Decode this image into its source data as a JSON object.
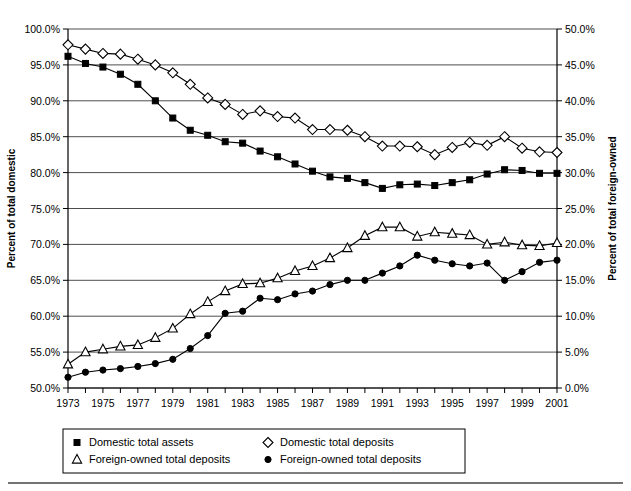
{
  "chart_data": {
    "type": "line",
    "title": "",
    "xlabel": "",
    "ylabel": "Percent of total domestic",
    "y2label": "Percent of total foreign-owned",
    "grid": true,
    "legend_position": "bottom",
    "xlim": [
      1973,
      2001
    ],
    "ylim": [
      50.0,
      100.0
    ],
    "y2lim": [
      0.0,
      50.0
    ],
    "x": [
      1973,
      1974,
      1975,
      1976,
      1977,
      1978,
      1979,
      1980,
      1981,
      1982,
      1983,
      1984,
      1985,
      1986,
      1987,
      1988,
      1989,
      1990,
      1991,
      1992,
      1993,
      1994,
      1995,
      1996,
      1997,
      1998,
      1999,
      2000,
      2001
    ],
    "xtick_labels": [
      "1973",
      "",
      "1975",
      "",
      "1977",
      "",
      "1979",
      "",
      "1981",
      "",
      "1983",
      "",
      "1985",
      "",
      "1987",
      "",
      "1989",
      "",
      "1991",
      "",
      "1993",
      "",
      "1995",
      "",
      "1997",
      "",
      "1999",
      "",
      "2001"
    ],
    "ytick_labels": [
      "50.0%",
      "55.0%",
      "60.0%",
      "65.0%",
      "70.0%",
      "75.0%",
      "80.0%",
      "85.0%",
      "90.0%",
      "95.0%",
      "100.0%"
    ],
    "ytick_values": [
      50,
      55,
      60,
      65,
      70,
      75,
      80,
      85,
      90,
      95,
      100
    ],
    "y2tick_labels": [
      "0.0%",
      "5.0%",
      "10.0%",
      "15.0%",
      "20.0%",
      "25.0%",
      "30.0%",
      "35.0%",
      "40.0%",
      "45.0%",
      "50.0%"
    ],
    "y2tick_values": [
      0,
      5,
      10,
      15,
      20,
      25,
      30,
      35,
      40,
      45,
      50
    ],
    "series": [
      {
        "name": "Domestic total assets",
        "marker": "filled-square",
        "axis": "left",
        "values": [
          96.2,
          95.2,
          94.7,
          93.7,
          92.3,
          90.0,
          87.6,
          85.9,
          85.2,
          84.3,
          84.1,
          83.0,
          82.2,
          81.2,
          80.2,
          79.4,
          79.2,
          78.6,
          77.8,
          78.3,
          78.4,
          78.2,
          78.6,
          79.0,
          79.8,
          80.4,
          80.3,
          79.9,
          79.9
        ]
      },
      {
        "name": "Domestic total deposits",
        "marker": "open-diamond",
        "axis": "left",
        "values": [
          97.8,
          97.2,
          96.6,
          96.5,
          95.8,
          95.0,
          93.9,
          92.3,
          90.4,
          89.5,
          88.1,
          88.6,
          87.8,
          87.6,
          86.0,
          86.0,
          85.9,
          85.0,
          83.7,
          83.7,
          83.6,
          82.5,
          83.5,
          84.2,
          83.8,
          85.0,
          83.4,
          82.9,
          82.8
        ]
      },
      {
        "name": "Foreign-owned total deposits",
        "marker": "open-triangle",
        "axis": "left",
        "values": [
          53.3,
          55.0,
          55.4,
          55.8,
          56.0,
          57.0,
          58.3,
          60.3,
          62.0,
          63.5,
          64.5,
          64.6,
          65.3,
          66.3,
          67.0,
          68.1,
          69.5,
          71.2,
          72.4,
          72.4,
          71.1,
          71.7,
          71.5,
          71.3,
          70.0,
          70.3,
          69.9,
          69.8,
          70.2
        ]
      },
      {
        "name": "Foreign-owned total deposits",
        "marker": "filled-circle",
        "axis": "left",
        "values": [
          51.5,
          52.2,
          52.5,
          52.7,
          53.0,
          53.4,
          54.0,
          55.5,
          57.3,
          60.4,
          60.7,
          62.5,
          62.3,
          63.1,
          63.5,
          64.4,
          65.0,
          65.0,
          66.0,
          67.0,
          68.5,
          67.8,
          67.3,
          67.0,
          67.4,
          65.0,
          66.2,
          67.5,
          67.8
        ]
      }
    ]
  },
  "legend": {
    "entries": [
      {
        "label": "Domestic total assets",
        "marker": "filled-square"
      },
      {
        "label": "Domestic total deposits",
        "marker": "open-diamond"
      },
      {
        "label": "Foreign-owned total deposits",
        "marker": "open-triangle"
      },
      {
        "label": "Foreign-owned total deposits",
        "marker": "filled-circle"
      }
    ]
  }
}
